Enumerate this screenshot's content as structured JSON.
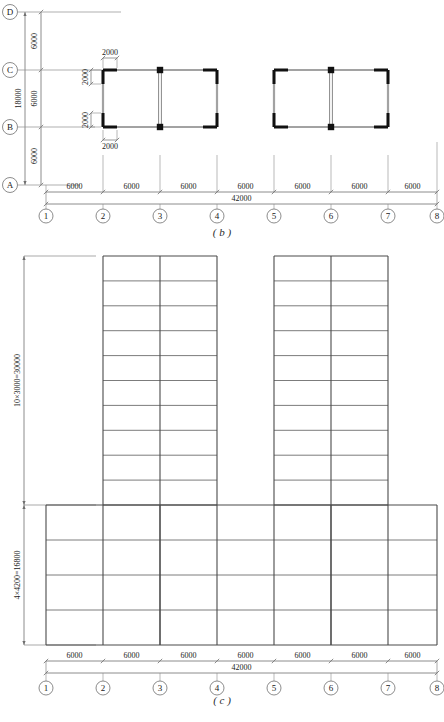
{
  "drawing": {
    "title": "Structural plan and elevation",
    "figures": [
      {
        "id": "b",
        "label": "( b )"
      },
      {
        "id": "c",
        "label": "( c )"
      }
    ],
    "colors": {
      "wall": "#111111",
      "beam": "#9a9a9a",
      "grid_line": "#8c8c8c",
      "dim_line": "#6f6f6f",
      "text": "#1a1a1a",
      "paper": "#ffffff"
    }
  },
  "plan": {
    "name": "figure-b-plan",
    "caption": "( b )",
    "vertical_axes": {
      "labels": [
        "D",
        "C",
        "B",
        "A"
      ],
      "spacings": [
        "6000",
        "6000",
        "6000"
      ],
      "total": "18000"
    },
    "horizontal_axes": {
      "labels": [
        "1",
        "2",
        "3",
        "4",
        "5",
        "6",
        "7",
        "8"
      ],
      "spacings": [
        "6000",
        "6000",
        "6000",
        "6000",
        "6000",
        "6000",
        "6000"
      ],
      "total": "42000"
    },
    "wall_dims": {
      "top": "2000",
      "bottom": "2000",
      "left_upper": "2000",
      "left_lower": "2000"
    },
    "cores": [
      {
        "name": "left-core",
        "from_grid": "2",
        "to_grid": "4",
        "from_axis": "B",
        "to_axis": "C"
      },
      {
        "name": "right-core",
        "from_grid": "5",
        "to_grid": "7",
        "from_axis": "B",
        "to_axis": "C"
      }
    ]
  },
  "elevation": {
    "name": "figure-c-elevation",
    "caption": "( c )",
    "vertical_dims": {
      "tower": "10×3000=30000",
      "podium": "4×4200=16800"
    },
    "tower_storeys": 10,
    "podium_storeys": 4,
    "horizontal_axes": {
      "labels": [
        "1",
        "2",
        "3",
        "4",
        "5",
        "6",
        "7",
        "8"
      ],
      "spacings": [
        "6000",
        "6000",
        "6000",
        "6000",
        "6000",
        "6000",
        "6000"
      ],
      "total": "42000"
    },
    "towers": [
      {
        "name": "left-tower",
        "from_grid": "2",
        "to_grid": "4",
        "bays": 2
      },
      {
        "name": "right-tower",
        "from_grid": "5",
        "to_grid": "7",
        "bays": 2
      }
    ],
    "podium": {
      "name": "podium-block",
      "from_grid": "1",
      "to_grid": "8",
      "bays": 7
    }
  }
}
